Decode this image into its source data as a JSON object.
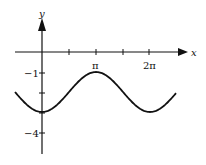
{
  "chart_data": {
    "type": "line",
    "title": "",
    "xlabel": "x",
    "ylabel": "y",
    "function": "y = -2 - cos(x)",
    "x_ticks": [
      "π",
      "2π"
    ],
    "y_ticks": [
      "-1",
      "-4"
    ],
    "x_tick_positions": [
      1.5708,
      3.1416,
      4.7124,
      6.2832
    ],
    "y_tick_positions": [
      -1,
      -2,
      -3,
      -4
    ],
    "series": [
      {
        "name": "curve",
        "x": [
          -1.0,
          0,
          1.5708,
          3.1416,
          4.7124,
          6.2832,
          7.2
        ],
        "y": [
          -2.54,
          -3,
          -2,
          -1,
          -2,
          -3,
          -2.6
        ]
      }
    ],
    "xlim": [
      -1.5,
      8.0
    ],
    "ylim": [
      -5.4,
      2.2
    ],
    "grid": false
  },
  "labels": {
    "x_axis": "x",
    "y_axis": "y",
    "pi": "π",
    "two_pi": "2π",
    "minus_one": "−1",
    "minus_four": "−4"
  }
}
